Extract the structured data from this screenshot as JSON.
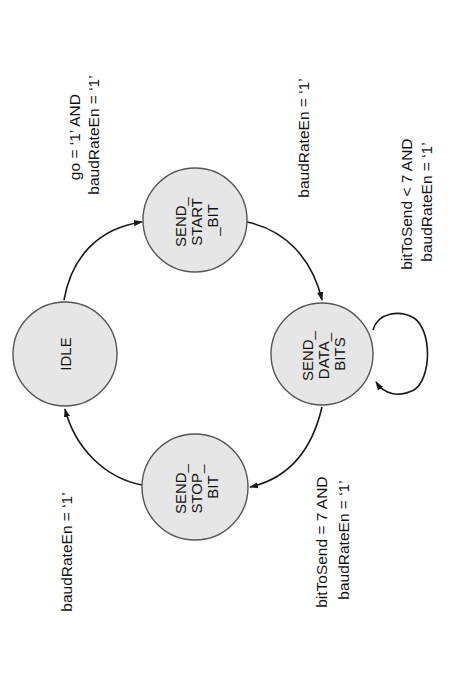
{
  "diagram": {
    "type": "state-machine",
    "orientation": "rotated -90deg",
    "colors": {
      "state_fill": "#e6e6e6",
      "state_stroke": "#555555",
      "edge": "#1a1a1a",
      "text": "#111111",
      "background": "#ffffff"
    },
    "states": [
      {
        "id": "IDLE",
        "lines": [
          "IDLE"
        ]
      },
      {
        "id": "SEND_START_BIT",
        "lines": [
          "SEND_",
          "START",
          "_BIT"
        ]
      },
      {
        "id": "SEND_DATA_BITS",
        "lines": [
          "SEND_",
          "DATA_",
          "BITS"
        ]
      },
      {
        "id": "SEND_STOP_BIT",
        "lines": [
          "SEND_",
          "STOP_",
          "BIT"
        ]
      }
    ],
    "transitions": [
      {
        "from": "IDLE",
        "to": "SEND_START_BIT",
        "lines": [
          "go = ‘1’ AND",
          "baudRateEn = ‘1’"
        ]
      },
      {
        "from": "SEND_START_BIT",
        "to": "SEND_DATA_BITS",
        "lines": [
          "baudRateEn = ‘1’"
        ]
      },
      {
        "from": "SEND_DATA_BITS",
        "to": "SEND_DATA_BITS",
        "lines": [
          "bitToSend < 7 AND",
          "baudRateEn = ‘1’"
        ]
      },
      {
        "from": "SEND_DATA_BITS",
        "to": "SEND_STOP_BIT",
        "lines": [
          "bitToSend = 7 AND",
          "baudRateEn = ‘1’"
        ]
      },
      {
        "from": "SEND_STOP_BIT",
        "to": "IDLE",
        "lines": [
          "baudRateEn = ‘1’"
        ]
      }
    ]
  }
}
